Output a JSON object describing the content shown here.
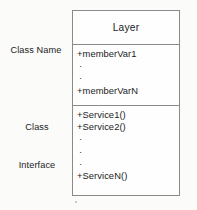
{
  "diagram": {
    "title": "Layer",
    "annotations": {
      "class_name": {
        "line1": "Class Name"
      },
      "class_interface": {
        "line1": "Class",
        "line2": "Interface"
      }
    },
    "compartments": {
      "attributes": [
        {
          "kind": "member",
          "text": "+memberVar1"
        },
        {
          "kind": "ellipsis",
          "text": "·"
        },
        {
          "kind": "ellipsis",
          "text": "·"
        },
        {
          "kind": "member",
          "text": "+memberVarN"
        }
      ],
      "operations": [
        {
          "kind": "member",
          "text": "+Service1()"
        },
        {
          "kind": "member",
          "text": "+Service2()"
        },
        {
          "kind": "ellipsis",
          "text": "·"
        },
        {
          "kind": "ellipsis",
          "text": "·"
        },
        {
          "kind": "ellipsis",
          "text": "·"
        },
        {
          "kind": "member",
          "text": "+ServiceN()"
        }
      ]
    },
    "colors": {
      "background": "#fbfbfa",
      "box_fill": "#fefefe",
      "border": "#8a8a8a",
      "text": "#1c1c1c"
    }
  }
}
